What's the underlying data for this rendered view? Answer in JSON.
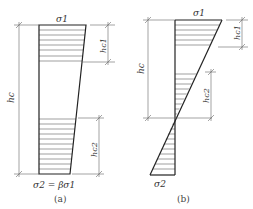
{
  "figure": {
    "panel_a": {
      "caption": "(a)",
      "top_stress": "σ1",
      "bottom_stress": "σ2 = βσ1",
      "dim_total": "hc",
      "dim_top": "hc1",
      "dim_bottom": "hc2"
    },
    "panel_b": {
      "caption": "(b)",
      "top_stress": "σ1",
      "bottom_stress": "σ2",
      "dim_total": "hc",
      "dim_top": "hc1",
      "dim_bottom": "hc2"
    }
  }
}
